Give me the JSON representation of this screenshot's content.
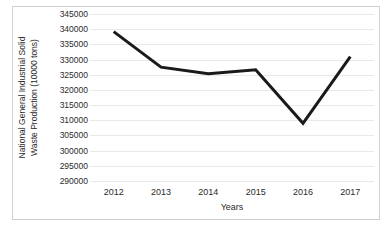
{
  "chart_data": {
    "type": "line",
    "title": "",
    "subtitle": "",
    "xlabel": "Years",
    "ylabel": "National General Industrial Solid Waste Production (10000 tons)",
    "ylabel_lines": [
      "National General Industrial Solid",
      "Waste Production (10000 tons)"
    ],
    "categories": [
      "2012",
      "2013",
      "2014",
      "2015",
      "2016",
      "2017"
    ],
    "x": [
      2012,
      2013,
      2014,
      2015,
      2016,
      2017
    ],
    "values": [
      339200,
      327500,
      325300,
      326600,
      309000,
      331000
    ],
    "series": [
      {
        "name": "National General Industrial Solid Waste Production",
        "values": [
          339200,
          327500,
          325300,
          326600,
          309000,
          331000
        ]
      }
    ],
    "ylim": [
      290000,
      345000
    ],
    "yticks": [
      290000,
      295000,
      300000,
      305000,
      310000,
      315000,
      320000,
      325000,
      330000,
      335000,
      340000,
      345000
    ],
    "ytick_labels": [
      "290000",
      "295000",
      "300000",
      "305000",
      "310000",
      "315000",
      "320000",
      "325000",
      "330000",
      "335000",
      "340000",
      "345000"
    ],
    "xtick_labels": [
      "2012",
      "2013",
      "2014",
      "2015",
      "2016",
      "2017"
    ],
    "grid": true,
    "grid_axis": "y",
    "legend": false,
    "legend_position": "none",
    "line_color": "#1a1a1a",
    "line_width": 3,
    "grid_color": "#e9e9e9",
    "text_color": "#2b2b2b",
    "background_color": "#ffffff",
    "border_color": "#d0d0d0",
    "markers": false,
    "annotations": []
  }
}
